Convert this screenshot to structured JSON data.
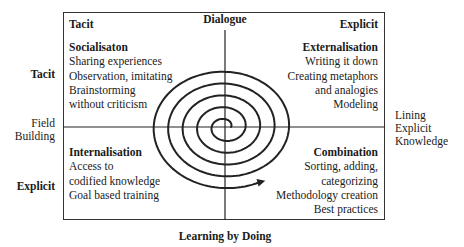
{
  "diagram": {
    "top_axis_label": "Dialogue",
    "bottom_axis_label": "Learning by Doing",
    "left_axis": {
      "top": "Tacit",
      "middle": [
        "Field",
        "Building"
      ],
      "bottom": "Explicit"
    },
    "right_axis": {
      "label": [
        "Lining",
        "Explicit",
        "Knowledge"
      ]
    },
    "corner_labels": {
      "top_left": "Tacit",
      "top_right": "Explicit"
    },
    "quadrants": {
      "socialisation": {
        "title": "Socialisaton",
        "items": [
          "Sharing experiences",
          "Observation, imitating",
          "Brainstorming",
          "without criticism"
        ]
      },
      "externalisation": {
        "title": "Externalisation",
        "items": [
          "Writing it down",
          "Creating metaphors",
          "and analogies",
          "Modeling"
        ]
      },
      "internalisation": {
        "title": "Internalisation",
        "items": [
          "Access to",
          "codified knowledge",
          "Goal based training"
        ]
      },
      "combination": {
        "title": "Combination",
        "items": [
          "Sorting, adding,",
          "categorizing",
          "Methodology creation",
          "Best practices"
        ]
      }
    },
    "spiral": {
      "center": [
        225,
        127
      ],
      "turns": 5,
      "direction": "outward-counterclockwise-with-arrow-up-left"
    },
    "colors": {
      "line": "#222222",
      "text": "#1a1a1a",
      "background": "#ffffff"
    }
  }
}
